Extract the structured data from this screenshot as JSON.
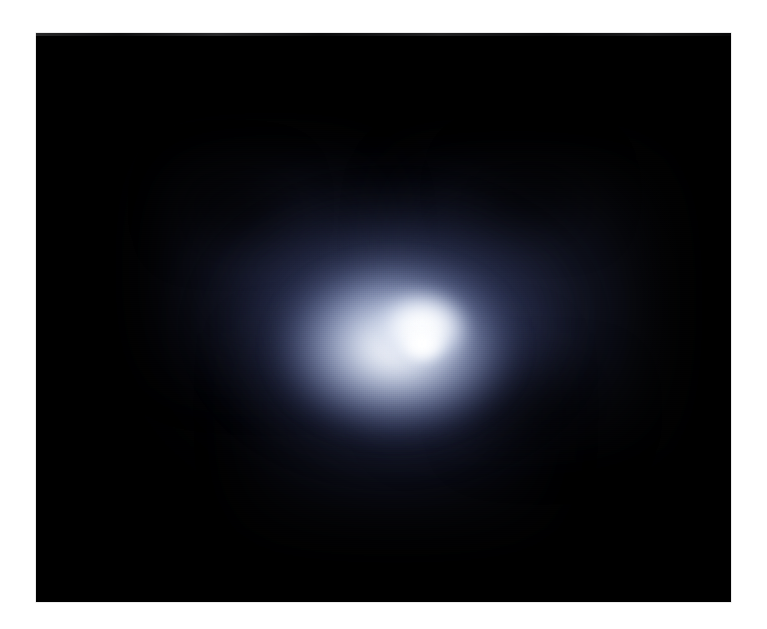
{
  "canvas": {
    "width": 767,
    "height": 629,
    "background_color": "#ffffff",
    "caption": ""
  },
  "plate": {
    "label": "astronomical-plate",
    "left": 36,
    "top": 33,
    "width": 695,
    "height": 569,
    "background_color": "#000000",
    "description": "Deep-field astronomical exposure of a bright unresolved nuclear source embedded in a diffuse bluish halo"
  },
  "subject": {
    "name": "bright-nuclear-source",
    "core_color": "#ffffff",
    "core_tint": "#f4f6fa",
    "inner_glow_color": "#dbe2f0",
    "mid_halo_color": "#70 7da4",
    "outer_halo_color": "#282e4e",
    "sky_background_color": "#000000",
    "core_center_x": 386,
    "core_center_y": 314,
    "halo_elongation": "horizontal",
    "halo_extent_x": [
      190,
      580
    ],
    "halo_extent_y": [
      180,
      480
    ]
  },
  "palette": {
    "white": "#ffffff",
    "core_white": "#fcfdff",
    "pale_blue": "#dbe2f0",
    "periwinkle": "#b9c4de",
    "slate_blue": "#707da4",
    "deep_navy": "#3a4468",
    "near_black_blue": "#1a1d30",
    "black": "#000000",
    "plate_border": "#d8d8d8"
  },
  "features": [
    {
      "name": "core",
      "kind": "saturated-white-nucleus"
    },
    {
      "name": "inner-glow",
      "kind": "bright-bluish-white-envelope"
    },
    {
      "name": "mid-halo",
      "kind": "periwinkle-diffuse-halo"
    },
    {
      "name": "outer-halo",
      "kind": "faint-navy-envelope"
    },
    {
      "name": "dark-lane-upper-left",
      "kind": "absorption-patch"
    },
    {
      "name": "dark-lane-upper-right",
      "kind": "absorption-patch"
    },
    {
      "name": "dark-lane-lower-right",
      "kind": "absorption-patch"
    },
    {
      "name": "scan-grain",
      "kind": "film-dither-texture"
    }
  ]
}
